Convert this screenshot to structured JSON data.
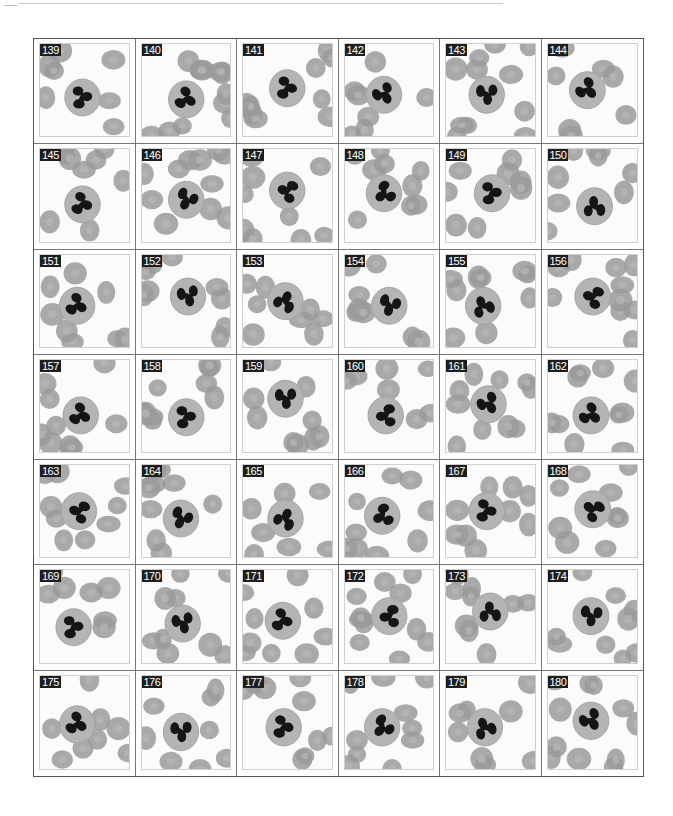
{
  "page": {
    "range": "139-180",
    "colors": {
      "background": "#ffffff",
      "rbc": "#9a9a9a",
      "cytoplasm": "#b4b4b4",
      "nucleus": "#151515",
      "label_bg": "#1e1e1e",
      "label_text": "#ffffff",
      "grid_line": "#777777"
    }
  },
  "cells": [
    {
      "n": "139",
      "cx": 48,
      "cy": 58,
      "rot": 0
    },
    {
      "n": "140",
      "cx": 50,
      "cy": 60,
      "rot": 30
    },
    {
      "n": "141",
      "cx": 50,
      "cy": 48,
      "rot": 10
    },
    {
      "n": "142",
      "cx": 44,
      "cy": 55,
      "rot": 60
    },
    {
      "n": "143",
      "cx": 46,
      "cy": 55,
      "rot": 90
    },
    {
      "n": "144",
      "cx": 44,
      "cy": 50,
      "rot": 45
    },
    {
      "n": "145",
      "cx": 48,
      "cy": 60,
      "rot": 20
    },
    {
      "n": "146",
      "cx": 50,
      "cy": 55,
      "rot": 120
    },
    {
      "n": "147",
      "cx": 50,
      "cy": 45,
      "rot": 200
    },
    {
      "n": "148",
      "cx": 44,
      "cy": 48,
      "rot": 150
    },
    {
      "n": "149",
      "cx": 52,
      "cy": 48,
      "rot": 0
    },
    {
      "n": "150",
      "cx": 52,
      "cy": 62,
      "rot": 270
    },
    {
      "n": "151",
      "cx": 42,
      "cy": 55,
      "rot": 30
    },
    {
      "n": "152",
      "cx": 52,
      "cy": 45,
      "rot": 80
    },
    {
      "n": "153",
      "cx": 48,
      "cy": 50,
      "rot": 300
    },
    {
      "n": "154",
      "cx": 50,
      "cy": 55,
      "rot": 110
    },
    {
      "n": "155",
      "cx": 42,
      "cy": 55,
      "rot": 250
    },
    {
      "n": "156",
      "cx": 50,
      "cy": 45,
      "rot": 200
    },
    {
      "n": "157",
      "cx": 46,
      "cy": 60,
      "rot": 30
    },
    {
      "n": "158",
      "cx": 50,
      "cy": 62,
      "rot": 0
    },
    {
      "n": "159",
      "cx": 48,
      "cy": 42,
      "rot": 90
    },
    {
      "n": "160",
      "cx": 46,
      "cy": 60,
      "rot": 180
    },
    {
      "n": "161",
      "cx": 48,
      "cy": 48,
      "rot": 60
    },
    {
      "n": "162",
      "cx": 48,
      "cy": 60,
      "rot": 40
    },
    {
      "n": "163",
      "cx": 44,
      "cy": 50,
      "rot": 200
    },
    {
      "n": "164",
      "cx": 44,
      "cy": 58,
      "rot": 120
    },
    {
      "n": "165",
      "cx": 48,
      "cy": 58,
      "rot": 300
    },
    {
      "n": "166",
      "cx": 42,
      "cy": 55,
      "rot": 160
    },
    {
      "n": "167",
      "cx": 46,
      "cy": 50,
      "rot": 10
    },
    {
      "n": "168",
      "cx": 50,
      "cy": 48,
      "rot": 220
    },
    {
      "n": "169",
      "cx": 38,
      "cy": 62,
      "rot": 0
    },
    {
      "n": "170",
      "cx": 46,
      "cy": 58,
      "rot": 80
    },
    {
      "n": "171",
      "cx": 45,
      "cy": 55,
      "rot": 20
    },
    {
      "n": "172",
      "cx": 50,
      "cy": 50,
      "rot": 180
    },
    {
      "n": "173",
      "cx": 50,
      "cy": 45,
      "rot": 270
    },
    {
      "n": "174",
      "cx": 48,
      "cy": 50,
      "rot": 100
    },
    {
      "n": "175",
      "cx": 42,
      "cy": 52,
      "rot": 30
    },
    {
      "n": "176",
      "cx": 44,
      "cy": 60,
      "rot": 90
    },
    {
      "n": "177",
      "cx": 46,
      "cy": 55,
      "rot": 10
    },
    {
      "n": "178",
      "cx": 42,
      "cy": 55,
      "rot": 140
    },
    {
      "n": "179",
      "cx": 44,
      "cy": 55,
      "rot": 250
    },
    {
      "n": "180",
      "cx": 48,
      "cy": 48,
      "rot": 60
    }
  ]
}
